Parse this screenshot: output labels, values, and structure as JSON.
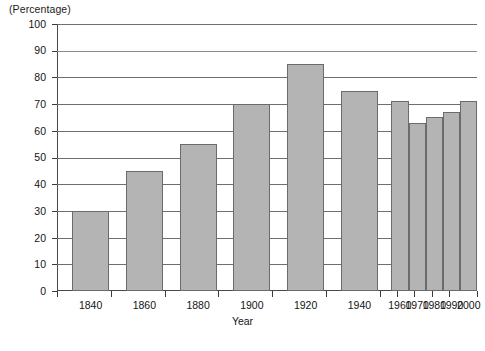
{
  "chart_data": {
    "type": "bar",
    "title": "",
    "subtitle": "",
    "ylabel": "(Percentage)",
    "xlabel": "Year",
    "ylim": [
      0,
      100
    ],
    "ytick_values": [
      0,
      10,
      20,
      30,
      40,
      50,
      60,
      70,
      80,
      90,
      100
    ],
    "ytick_labels": [
      "0",
      "10",
      "20",
      "30",
      "40",
      "50",
      "60",
      "70",
      "80",
      "90",
      "100"
    ],
    "grid": "horizontal",
    "legend": "none",
    "categories": [
      "1840",
      "1860",
      "1880",
      "1900",
      "1920",
      "1940",
      "1960",
      "1970",
      "1980",
      "1990",
      "2000"
    ],
    "values": [
      30,
      45,
      55,
      70,
      85,
      75,
      71,
      63,
      65,
      67,
      71
    ],
    "bars": [
      {
        "category": "1840",
        "value": 30,
        "left_pct": 3.6,
        "width_pct": 8.8
      },
      {
        "category": "1860",
        "value": 45,
        "left_pct": 16.4,
        "width_pct": 8.8
      },
      {
        "category": "1880",
        "value": 55,
        "left_pct": 29.2,
        "width_pct": 8.8
      },
      {
        "category": "1900",
        "value": 70,
        "left_pct": 42.0,
        "width_pct": 8.8
      },
      {
        "category": "1920",
        "value": 85,
        "left_pct": 54.8,
        "width_pct": 8.8
      },
      {
        "category": "1940",
        "value": 75,
        "left_pct": 67.6,
        "width_pct": 8.8
      },
      {
        "category": "1960",
        "value": 71,
        "left_pct": 79.6,
        "width_pct": 4.1
      },
      {
        "category": "1970",
        "value": 63,
        "left_pct": 83.7,
        "width_pct": 4.1
      },
      {
        "category": "1980",
        "value": 65,
        "left_pct": 87.8,
        "width_pct": 4.1
      },
      {
        "category": "1990",
        "value": 67,
        "left_pct": 91.9,
        "width_pct": 4.1
      },
      {
        "category": "2000",
        "value": 71,
        "left_pct": 96.0,
        "width_pct": 4.1
      }
    ],
    "xtick_positions_pct": [
      0.0,
      12.8,
      25.6,
      38.4,
      51.2,
      64.0,
      76.8,
      81.0,
      85.1,
      89.2,
      93.3,
      100.0
    ],
    "colors": {
      "bar_fill": "#b4b4b4",
      "bar_border": "#6b6b6b",
      "gridline": "#6e6e6e",
      "axis": "#3a3a3a",
      "text": "#141414",
      "background": "#ffffff"
    }
  },
  "footer": {
    "source_note": ""
  }
}
